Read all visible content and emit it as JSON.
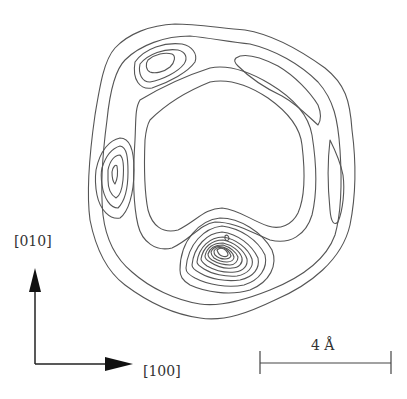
{
  "figure": {
    "type": "contour-map",
    "axes": {
      "vertical_label": "[010]",
      "horizontal_label": "[100]"
    },
    "scale_bar": {
      "label": "4 Å",
      "length_value": 4,
      "unit": "Å"
    },
    "colors": {
      "contour": "#555555",
      "arrow": "#111111",
      "text": "#333333",
      "background": "#ffffff"
    },
    "features": {
      "outer_ring_contours": 2,
      "top_left_peak_contours": 3,
      "left_peak_contours": 4,
      "top_right_peak_contours": 1,
      "right_peak_contours": 1,
      "central_bottom_peak_contours": 11
    }
  }
}
